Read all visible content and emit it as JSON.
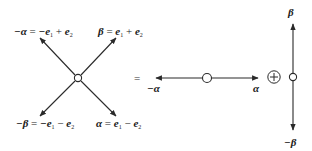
{
  "diagram": {
    "left": {
      "center_node": {
        "x": 78,
        "y": 78,
        "shape": "small-circle"
      },
      "arrows": [
        {
          "id": "neg-alpha",
          "to": [
            40,
            38
          ],
          "label_lhs": "−α",
          "label_rhs_a": "−e",
          "sub_a": "1",
          "op": "+",
          "label_rhs_b": "e",
          "sub_b": "2"
        },
        {
          "id": "beta",
          "to": [
            116,
            38
          ],
          "label_lhs": "β",
          "label_rhs_a": "e",
          "sub_a": "1",
          "op": "+",
          "label_rhs_b": "e",
          "sub_b": "2"
        },
        {
          "id": "neg-beta",
          "to": [
            40,
            116
          ],
          "label_lhs": "−β",
          "label_rhs_a": "−e",
          "sub_a": "1",
          "op": "−",
          "label_rhs_b": "e",
          "sub_b": "2"
        },
        {
          "id": "alpha",
          "to": [
            116,
            116
          ],
          "label_lhs": "α",
          "label_rhs_a": "e",
          "sub_a": "1",
          "op": "−",
          "label_rhs_b": "e",
          "sub_b": "2"
        }
      ]
    },
    "equals": "=",
    "middle": {
      "node": {
        "x": 207,
        "y": 78
      },
      "left_label": "−α",
      "right_label": "α"
    },
    "direct_sum": "⊕",
    "right": {
      "node": {
        "x": 293,
        "y": 77
      },
      "top_label": "β",
      "bottom_label": "−β"
    },
    "colors": {
      "stroke": "#2a2a2a",
      "text": "#1a1a1a",
      "background": "#ffffff"
    }
  }
}
